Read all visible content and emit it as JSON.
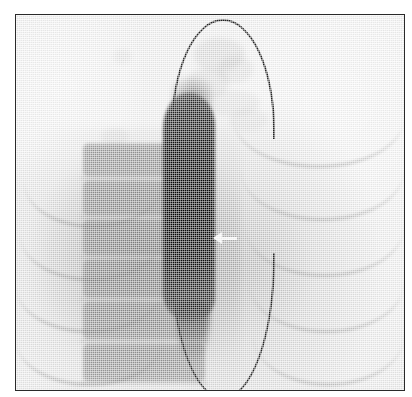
{
  "figure": {
    "kind": "radiograph",
    "modality": "fluoroscopy",
    "caption": "",
    "frame_border_color": "#2a2a2a",
    "film_background_color": "#f3f3f3",
    "width_px": 412,
    "height_px": 397
  },
  "annotations": {
    "arrow": {
      "name": "pointer-arrow",
      "direction": "left",
      "color": "#ffffff",
      "x_px": 197,
      "y_px": 216,
      "label": ""
    }
  },
  "anatomy": {
    "balloon": {
      "label": "balloon-catheter-outline",
      "color": "#222222",
      "shape": "vertical-ellipse-pointed-ends",
      "apex_y_px": 18,
      "tip_y_px": 382,
      "left_x_px": 155,
      "right_x_px": 259
    },
    "contrast_column": {
      "label": "opacified-contrast-column",
      "color": "#050505",
      "top_y_px": 78,
      "bottom_y_px": 306
    },
    "spine": {
      "label": "vertebral-column",
      "color": "#6e6e6e",
      "vertebrae": [
        {
          "top_pct": 2,
          "height_pct": 13
        },
        {
          "top_pct": 17,
          "height_pct": 14
        },
        {
          "top_pct": 33,
          "height_pct": 14
        },
        {
          "top_pct": 49,
          "height_pct": 15
        },
        {
          "top_pct": 66,
          "height_pct": 15
        },
        {
          "top_pct": 83,
          "height_pct": 15
        }
      ]
    },
    "ribs": {
      "label": "posterior-ribs",
      "color": "#696969",
      "right_side": [
        {
          "left_pct": 56,
          "top_pct": 14,
          "width_pct": 44,
          "height_pct": 26
        },
        {
          "left_pct": 58,
          "top_pct": 28,
          "width_pct": 42,
          "height_pct": 26
        },
        {
          "left_pct": 59,
          "top_pct": 43,
          "width_pct": 41,
          "height_pct": 26
        },
        {
          "left_pct": 60,
          "top_pct": 58,
          "width_pct": 40,
          "height_pct": 26
        },
        {
          "left_pct": 61,
          "top_pct": 72,
          "width_pct": 39,
          "height_pct": 26
        }
      ],
      "left_side": [
        {
          "left_pct": 2,
          "top_pct": 32,
          "width_pct": 36,
          "height_pct": 24
        },
        {
          "left_pct": 1,
          "top_pct": 46,
          "width_pct": 37,
          "height_pct": 24
        },
        {
          "left_pct": 0,
          "top_pct": 60,
          "width_pct": 38,
          "height_pct": 24
        },
        {
          "left_pct": 0,
          "top_pct": 74,
          "width_pct": 38,
          "height_pct": 24
        }
      ]
    },
    "mottle": {
      "label": "residual-contrast-mottle",
      "color": "#767676",
      "blobs": [
        {
          "left_pct": 46,
          "top_pct": 6,
          "w_pct": 13,
          "h_pct": 9,
          "op": 0.38
        },
        {
          "left_pct": 52,
          "top_pct": 11,
          "w_pct": 9,
          "h_pct": 7,
          "op": 0.3
        },
        {
          "left_pct": 44,
          "top_pct": 14,
          "w_pct": 11,
          "h_pct": 8,
          "op": 0.34
        },
        {
          "left_pct": 49,
          "top_pct": 20,
          "w_pct": 14,
          "h_pct": 7,
          "op": 0.26
        },
        {
          "left_pct": 41,
          "top_pct": 23,
          "w_pct": 8,
          "h_pct": 6,
          "op": 0.3
        },
        {
          "left_pct": 55,
          "top_pct": 25,
          "w_pct": 10,
          "h_pct": 6,
          "op": 0.22
        },
        {
          "left_pct": 25,
          "top_pct": 9,
          "w_pct": 5,
          "h_pct": 4,
          "op": 0.22
        },
        {
          "left_pct": 22,
          "top_pct": 30,
          "w_pct": 7,
          "h_pct": 5,
          "op": 0.24
        }
      ]
    }
  }
}
